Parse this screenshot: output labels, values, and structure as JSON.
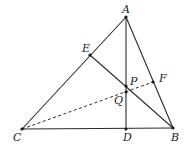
{
  "diagram": {
    "type": "geometry-triangle",
    "points": {
      "A": {
        "label": "A",
        "x": 126,
        "y": 17,
        "lx": 122,
        "ly": 13
      },
      "B": {
        "label": "B",
        "x": 173,
        "y": 128,
        "lx": 171,
        "ly": 141
      },
      "C": {
        "label": "C",
        "x": 22,
        "y": 129,
        "lx": 13,
        "ly": 141
      },
      "D": {
        "label": "D",
        "x": 126,
        "y": 129,
        "lx": 123,
        "ly": 141
      },
      "E": {
        "label": "E",
        "x": 90,
        "y": 55,
        "lx": 82,
        "ly": 52
      },
      "F": {
        "label": "F",
        "x": 153,
        "y": 82,
        "lx": 159,
        "ly": 82
      },
      "P": {
        "label": "P",
        "x": 126,
        "y": 86,
        "lx": 130,
        "ly": 85
      },
      "Q": {
        "label": "Q",
        "x": 126,
        "y": 92,
        "lx": 114,
        "ly": 104
      }
    },
    "segments": [
      {
        "from": "A",
        "to": "C",
        "style": "solid"
      },
      {
        "from": "A",
        "to": "B",
        "style": "solid"
      },
      {
        "from": "C",
        "to": "B",
        "style": "solid"
      },
      {
        "from": "A",
        "to": "D",
        "style": "solid"
      },
      {
        "from": "E",
        "to": "B",
        "style": "solid"
      },
      {
        "from": "C",
        "to": "F",
        "style": "dashed"
      }
    ]
  }
}
